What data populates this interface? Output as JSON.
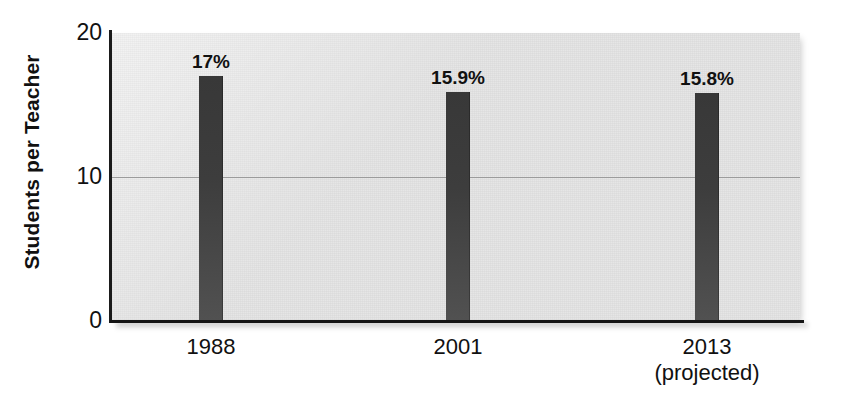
{
  "chart_data": {
    "type": "bar",
    "title": "",
    "subtitle": "",
    "xlabel": "",
    "ylabel": "Students per Teacher",
    "categories": [
      "1988",
      "2001",
      "2013"
    ],
    "category_sublabels": [
      "",
      "",
      "(projected)"
    ],
    "values": [
      17,
      15.9,
      15.8
    ],
    "data_labels": [
      "17%",
      "15.9%",
      "15.8%"
    ],
    "ylim": [
      0,
      20
    ],
    "yticks": [
      0,
      10,
      20
    ],
    "ytick_labels": [
      "0",
      "10",
      "20"
    ],
    "grid": "horizontal-at-10-only",
    "legend": "none",
    "bar_color": "#3f3f3f",
    "plot_background": "#e4e4e4",
    "axis_color": "#151515",
    "gridline_color": "#9b9b9b"
  },
  "axes": {
    "y": {
      "label": "Students per Teacher",
      "ticks": [
        {
          "value": 20,
          "label": "20"
        },
        {
          "value": 10,
          "label": "10"
        },
        {
          "value": 0,
          "label": "0"
        }
      ]
    },
    "x": {
      "ticks": [
        {
          "label": "1988",
          "sublabel": ""
        },
        {
          "label": "2001",
          "sublabel": ""
        },
        {
          "label": "2013",
          "sublabel": "(projected)"
        }
      ]
    }
  },
  "bars": [
    {
      "category": "1988",
      "value": 17,
      "data_label": "17%"
    },
    {
      "category": "2001",
      "value": 15.9,
      "data_label": "15.9%"
    },
    {
      "category": "2013",
      "value": 15.8,
      "data_label": "15.8%"
    }
  ]
}
